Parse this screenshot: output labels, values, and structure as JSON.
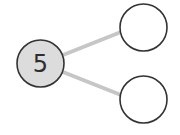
{
  "diagram": {
    "type": "number-bond",
    "whole": {
      "value": "5",
      "fill": "#dcdcdc",
      "stroke": "#333333",
      "cx": 40.5,
      "cy": 63.5,
      "r": 24
    },
    "parts": [
      {
        "value": "",
        "fill": "#ffffff",
        "stroke": "#333333",
        "cx": 143.5,
        "cy": 27.5,
        "r": 23.5
      },
      {
        "value": "",
        "fill": "#ffffff",
        "stroke": "#333333",
        "cx": 143.5,
        "cy": 99.5,
        "r": 23.5
      }
    ],
    "connector_color": "#c6c6c6"
  }
}
